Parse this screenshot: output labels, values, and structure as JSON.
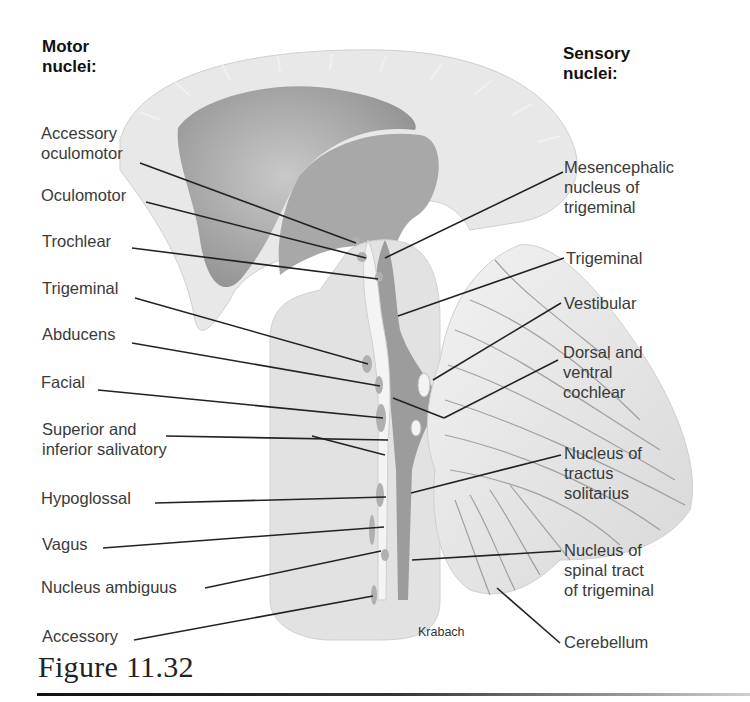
{
  "figure": {
    "caption": "Figure 11.32",
    "credit": "Krabach"
  },
  "motor": {
    "heading": "Motor\nnuclei:",
    "labels": [
      {
        "text": "Accessory\noculomotor"
      },
      {
        "text": "Oculomotor"
      },
      {
        "text": "Trochlear"
      },
      {
        "text": "Trigeminal"
      },
      {
        "text": "Abducens"
      },
      {
        "text": "Facial"
      },
      {
        "text": "Superior and\ninferior salivatory"
      },
      {
        "text": "Hypoglossal"
      },
      {
        "text": "Vagus"
      },
      {
        "text": "Nucleus ambiguus"
      },
      {
        "text": "Accessory"
      }
    ]
  },
  "sensory": {
    "heading": "Sensory\nnuclei:",
    "labels": [
      {
        "text": "Mesencephalic\nnucleus of\ntrigeminal"
      },
      {
        "text": "Trigeminal"
      },
      {
        "text": "Vestibular"
      },
      {
        "text": "Dorsal and\nventral\ncochlear"
      },
      {
        "text": "Nucleus of\ntractus\nsolitarius"
      },
      {
        "text": "Nucleus of\nspinal tract\nof trigeminal"
      },
      {
        "text": "Cerebellum"
      }
    ]
  },
  "colors": {
    "cortex": "#e6e6e6",
    "ventricle": "#9a9a9a",
    "brainstem": "#e2e2e2",
    "nucleus": "#b5b5b5",
    "leader": "#222222"
  }
}
